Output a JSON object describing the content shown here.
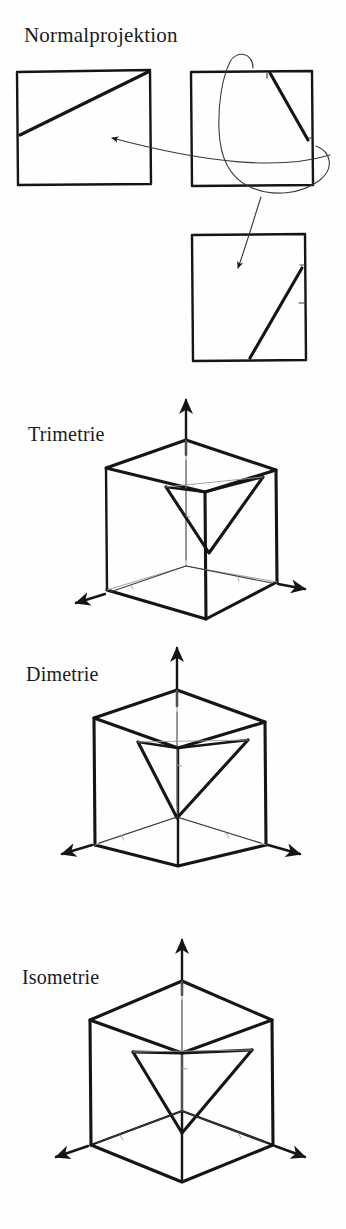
{
  "figure": {
    "background_color": "#fefefe",
    "ink_color": "#151515",
    "width": 346,
    "height": 1229
  },
  "sections": [
    {
      "id": "normalprojektion",
      "label": "Normalprojektion",
      "description": "Drei quadratische Risse mit Diagonalen und Pfeilen",
      "panels": [
        {
          "name": "front-view-square",
          "diagonal": "left-edge to top-right corner"
        },
        {
          "name": "top-view-square",
          "diagonal": "top-edge to right-edge"
        },
        {
          "name": "side-view-square",
          "diagonal": "bottom-edge to right-edge"
        }
      ]
    },
    {
      "id": "trimetrie",
      "label": "Trimetrie",
      "description": "Wuerfel mit drei Achsen und eingeschriebenem Dreieck"
    },
    {
      "id": "dimetrie",
      "label": "Dimetrie",
      "description": "Wuerfel mit drei Achsen und eingeschriebenem Dreieck"
    },
    {
      "id": "isometrie",
      "label": "Isometrie",
      "description": "Wuerfel mit drei Achsen und eingeschriebenem Dreieck"
    }
  ],
  "icons": {
    "arrow": "arrow-head",
    "axis": "axis-line",
    "swirl": "curved-swirl-arrow"
  }
}
